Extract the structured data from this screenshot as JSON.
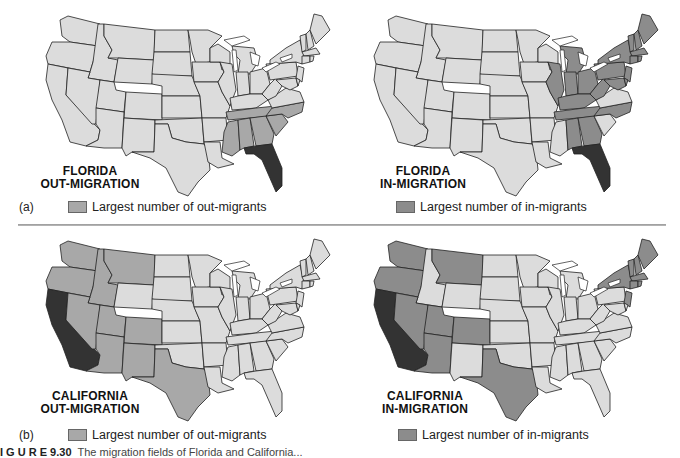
{
  "colors": {
    "default": "#dcdcdc",
    "out_shade": "#a8a8a8",
    "in_shade": "#8c8c8c",
    "origin": "#333333",
    "lake": "#ffffff"
  },
  "panels": [
    {
      "id": "florida-out",
      "title_line1": "FLORIDA",
      "title_line2": "OUT-MIGRATION",
      "origin": "FL",
      "shade": "out",
      "shaded_states": [
        "TN",
        "MS",
        "AL",
        "GA",
        "SC",
        "NC"
      ]
    },
    {
      "id": "florida-in",
      "title_line1": "FLORIDA",
      "title_line2": "IN-MIGRATION",
      "origin": "FL",
      "shade": "in",
      "shaded_states": [
        "MI",
        "IL",
        "IN",
        "OH",
        "KY",
        "TN",
        "WV",
        "PA",
        "NY",
        "NJ",
        "MD",
        "DE",
        "ME",
        "NH",
        "VT",
        "MA",
        "CT",
        "RI",
        "NC",
        "AL",
        "GA"
      ]
    },
    {
      "id": "california-out",
      "title_line1": "CALIFORNIA",
      "title_line2": "OUT-MIGRATION",
      "origin": "CA",
      "shade": "out",
      "shaded_states": [
        "WA",
        "OR",
        "ID",
        "MT",
        "NV",
        "UT",
        "CO",
        "AZ",
        "NM",
        "TX"
      ]
    },
    {
      "id": "california-in",
      "title_line1": "CALIFORNIA",
      "title_line2": "IN-MIGRATION",
      "origin": "CA",
      "shade": "in",
      "shaded_states": [
        "WA",
        "OR",
        "MT",
        "NV",
        "UT",
        "CO",
        "AZ",
        "TX",
        "NY",
        "NJ",
        "ME",
        "NH",
        "VT",
        "MA",
        "CT",
        "RI"
      ]
    }
  ],
  "section_a": {
    "label": "(a)",
    "legend_out": "Largest number of out-migrants",
    "legend_in": "Largest number of in-migrants"
  },
  "section_b": {
    "label": "(b)",
    "legend_out": "Largest number of out-migrants",
    "legend_in": "Largest number of in-migrants"
  },
  "caption": {
    "figure_label": "I G U R E   9.30",
    "text": "The migration fields of Florida and California..."
  }
}
